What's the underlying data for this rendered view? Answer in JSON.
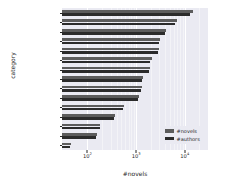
{
  "chart_data": {
    "type": "bar",
    "orientation": "horizontal",
    "title": "",
    "xlabel": "#novels",
    "ylabel": "category",
    "xscale": "log",
    "xlim": [
      30,
      30000
    ],
    "grid": true,
    "legend_position": "lower right",
    "xticks": [
      {
        "label": "10",
        "exp": "2",
        "value": 100
      },
      {
        "label": "10",
        "exp": "3",
        "value": 1000
      },
      {
        "label": "10",
        "exp": "4",
        "value": 10000
      }
    ],
    "categories": [
      "Xuanhuan",
      "Modern",
      "Xianxia",
      "Sci-fi",
      "Fantasy",
      "2D World",
      "Game",
      "History",
      "Wuxia",
      "Supernatural",
      "Short",
      "Career",
      "Competition",
      "Military",
      "Others"
    ],
    "series": [
      {
        "name": "#novels",
        "color": "#5c5c5c",
        "values": [
          15000,
          7000,
          4200,
          3100,
          3000,
          2100,
          1900,
          1400,
          1350,
          1150,
          560,
          370,
          185,
          160,
          45
        ]
      },
      {
        "name": "#authors",
        "color": "#2b2b2b",
        "values": [
          13000,
          6300,
          3900,
          2900,
          2800,
          1950,
          1800,
          1330,
          1280,
          1090,
          530,
          355,
          178,
          152,
          43
        ]
      }
    ]
  },
  "legend": {
    "items": [
      {
        "label": "#novels"
      },
      {
        "label": "#authors"
      }
    ]
  }
}
